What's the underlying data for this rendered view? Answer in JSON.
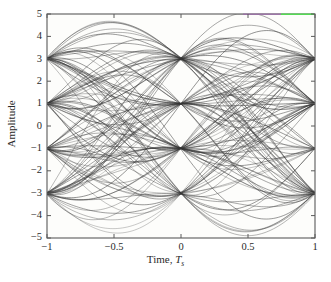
{
  "figure": {
    "kind": "eye-diagram",
    "background_color": "#ffffff",
    "plot_background_color": "#fdfdfb",
    "frame_color": "#5a5a5a",
    "trace_color": "#353535",
    "artifact_colors": {
      "purple": "#9b6fa8",
      "green": "#4ce04c"
    }
  },
  "axes": {
    "x": {
      "label_prefix": "Time, ",
      "label_var": "T",
      "label_sub": "s",
      "ticks": [
        "−1",
        "−0.5",
        "0",
        "0.5",
        "1"
      ],
      "tick_values": [
        -1,
        -0.5,
        0,
        0.5,
        1
      ],
      "range": [
        -1,
        1
      ]
    },
    "y": {
      "label": "Amplitude",
      "ticks": [
        "5",
        "4",
        "3",
        "2",
        "1",
        "0",
        "−1",
        "−2",
        "−3",
        "−4",
        "−5"
      ],
      "tick_values": [
        5,
        4,
        3,
        2,
        1,
        0,
        -1,
        -2,
        -3,
        -4,
        -5
      ],
      "range": [
        -5,
        5
      ]
    }
  },
  "chart_data": {
    "type": "line",
    "title": "",
    "xlabel": "Time, Ts",
    "ylabel": "Amplitude",
    "xlim": [
      -1,
      1
    ],
    "ylim": [
      -5,
      5
    ],
    "grid": false,
    "legend": null,
    "modulation_levels": [
      -3,
      -1,
      1,
      3
    ],
    "crossing_times": [
      -1,
      0,
      1
    ],
    "eye_center_times": [
      -0.5,
      0.5
    ],
    "eye_opening_levels": [
      -2,
      0,
      2
    ],
    "peak_overshoot": 4.25,
    "min_overshoot": -4.25,
    "num_traces": 120,
    "series": [
      {
        "name": "eye-traces",
        "x": [
          -1,
          -0.75,
          -0.5,
          -0.25,
          0,
          0.25,
          0.5,
          0.75,
          1
        ],
        "values": [
          3,
          3.4,
          3,
          2.1,
          1,
          0.1,
          -1,
          -2.1,
          -3
        ]
      }
    ]
  }
}
